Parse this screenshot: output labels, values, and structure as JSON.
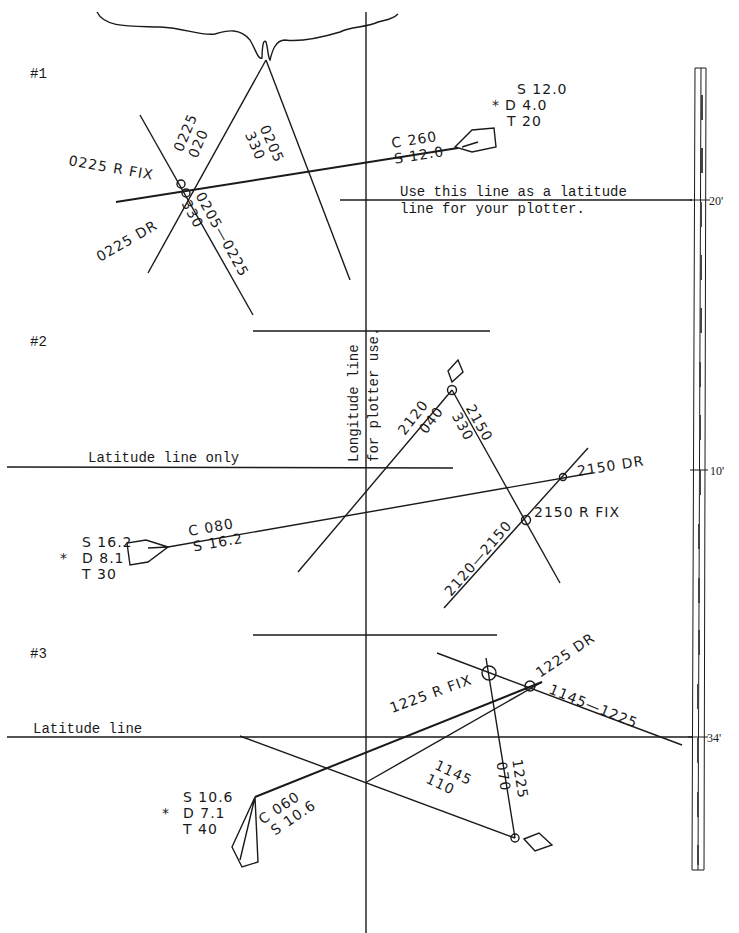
{
  "problems": [
    {
      "label": "#1",
      "dr_info": {
        "marker": "*",
        "speed": "S 12.0",
        "distance": "D 4.0",
        "time": "T 20"
      },
      "course_label": "C 260",
      "speed_label": "S 12.0",
      "lop1_time": "0225",
      "lop1_bearing": "020",
      "lop2_time": "0205",
      "lop2_bearing": "330",
      "advanced_lop": "0205—0225",
      "advanced_bearing": "330",
      "fix_label": "0225 R FIX",
      "dr_label": "0225 DR",
      "note_line1": "Use this line as a latitude",
      "note_line2": "line for your plotter."
    },
    {
      "label": "#2",
      "dr_info": {
        "marker": "*",
        "speed": "S 16.2",
        "distance": "D 8.1",
        "time": "T 30"
      },
      "course_label": "C 080",
      "speed_label": "S 16.2",
      "lop1_time": "2120",
      "lop1_bearing": "040",
      "lop2_time": "2150",
      "lop2_bearing": "330",
      "advanced_lop": "2120—2150",
      "fix_label": "2150 R FIX",
      "dr_label": "2150 DR",
      "latitude_note": "Latitude line only"
    },
    {
      "label": "#3",
      "dr_info": {
        "marker": "*",
        "speed": "S 10.6",
        "distance": "D 7.1",
        "time": "T 40"
      },
      "course_label": "C 060",
      "speed_label": "S 10.6",
      "lop1_time": "1145",
      "lop1_bearing": "110",
      "lop2_time": "1225",
      "lop2_bearing": "070",
      "advanced_lop": "1145—1225",
      "fix_label": "1225 R FIX",
      "dr_label": "1225 DR",
      "latitude_note": "Latitude line"
    }
  ],
  "longitude_note_line1": "Longitude line",
  "longitude_note_line2": "for plotter use.",
  "scale": {
    "labels": [
      "20'",
      "10'",
      "34'"
    ]
  }
}
